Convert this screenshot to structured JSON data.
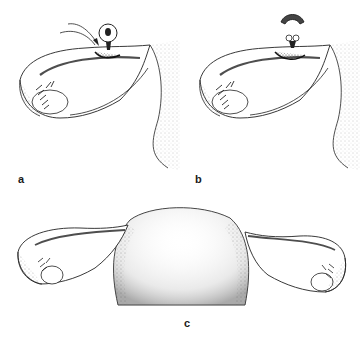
{
  "figure": {
    "panels": [
      {
        "id": "a",
        "label": "a",
        "description": "Adnexa with tube and ovary; small paratubal cyst on pedicle with arrow indicating ligation site"
      },
      {
        "id": "b",
        "label": "b",
        "description": "Cyst excised; ligated stump remaining at tube"
      },
      {
        "id": "c",
        "label": "c",
        "description": "Uterus with both tubes and ovaries after procedure"
      }
    ],
    "colors": {
      "ink": "#1a1a1a",
      "stipple": "#555555",
      "background": "#ffffff"
    }
  }
}
